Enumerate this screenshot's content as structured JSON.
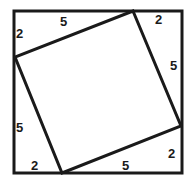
{
  "diagram": {
    "outer_square": {
      "x": 14,
      "y": 11,
      "size": 168
    },
    "inner_square_vertices": [
      [
        133,
        11
      ],
      [
        181,
        126
      ],
      [
        62,
        173
      ],
      [
        15,
        57
      ]
    ],
    "labels": {
      "top_left_short": "2",
      "top_long": "5",
      "top_right_short": "2",
      "right_long": "5",
      "right_short": "2",
      "bottom_long": "5",
      "bottom_short": "2",
      "left_long": "5"
    },
    "colors": {
      "stroke": "#1a1a1a",
      "background": "#ffffff"
    }
  }
}
